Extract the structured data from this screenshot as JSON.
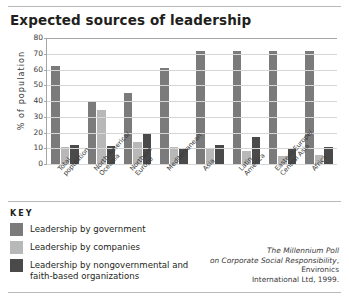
{
  "title": "Expected sources of leadership",
  "key": {
    "heading": "KEY",
    "items": [
      {
        "label": "Leadership by government",
        "color": "#7b7b7b"
      },
      {
        "label": "Leadership by companies",
        "color": "#b8b8b8"
      },
      {
        "label": "Leadership by nongovernmental and faith-based organizations",
        "color": "#4a4a4a"
      }
    ]
  },
  "source": {
    "line1": "The Millennium Poll",
    "line2_italic": "on Corporate Social Responsibility",
    "line2_rest": ", Environics",
    "line3": "International Ltd, 1999."
  },
  "chart_data": {
    "type": "bar",
    "title": "Expected sources of leadership",
    "xlabel": "",
    "ylabel": "% of population",
    "ylim": [
      0,
      80
    ],
    "ytick_values": [
      0,
      10,
      20,
      30,
      40,
      50,
      60,
      70,
      80
    ],
    "grid": true,
    "legend_position": "below-left",
    "categories": [
      "Total population",
      "North America/ Oceania",
      "Northern Europe",
      "Mediterranean",
      "Asia",
      "Latin America",
      "Eastern Europe/ Central Asia",
      "Africa"
    ],
    "series": [
      {
        "name": "Leadership by government",
        "color": "#7b7b7b",
        "values": [
          62,
          40,
          45,
          61,
          72,
          72,
          72,
          72
        ]
      },
      {
        "name": "Leadership by companies",
        "color": "#b8b8b8",
        "values": [
          11,
          34,
          14,
          11,
          10,
          8,
          5,
          6
        ]
      },
      {
        "name": "Leadership by nongovernmental and faith-based organizations",
        "color": "#4a4a4a",
        "values": [
          12,
          11.5,
          20,
          10,
          12,
          17,
          10,
          11
        ]
      }
    ]
  }
}
